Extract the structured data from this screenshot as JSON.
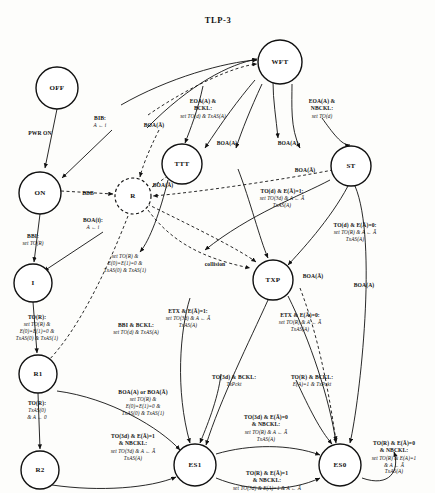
{
  "diagram": {
    "title": "TLP-3",
    "type": "state-transition-diagram",
    "states": [
      {
        "id": "OFF",
        "label": "OFF",
        "x": 57,
        "y": 88,
        "r": 21,
        "dashed": false
      },
      {
        "id": "ON",
        "label": "ON",
        "x": 40,
        "y": 193,
        "r": 21,
        "dashed": false
      },
      {
        "id": "I",
        "label": "I",
        "x": 33,
        "y": 283,
        "r": 19,
        "dashed": false
      },
      {
        "id": "R1",
        "label": "R1",
        "x": 38,
        "y": 374,
        "r": 19,
        "dashed": false
      },
      {
        "id": "R2",
        "label": "R2",
        "x": 40,
        "y": 470,
        "r": 19,
        "dashed": false
      },
      {
        "id": "R",
        "label": "R",
        "x": 133,
        "y": 196,
        "r": 18,
        "dashed": true
      },
      {
        "id": "TTT",
        "label": "TTT",
        "x": 182,
        "y": 164,
        "r": 20,
        "dashed": false
      },
      {
        "id": "WFT",
        "label": "WFT",
        "x": 280,
        "y": 62,
        "r": 22,
        "dashed": false
      },
      {
        "id": "ST",
        "label": "ST",
        "x": 351,
        "y": 166,
        "r": 20,
        "dashed": false
      },
      {
        "id": "TXP",
        "label": "TXP",
        "x": 273,
        "y": 280,
        "r": 20,
        "dashed": false
      },
      {
        "id": "ES1",
        "label": "ES1",
        "x": 195,
        "y": 465,
        "r": 21,
        "dashed": false
      },
      {
        "id": "ES0",
        "label": "ES0",
        "x": 340,
        "y": 465,
        "r": 21,
        "dashed": false
      }
    ],
    "labels": [
      {
        "id": "pwr-on",
        "cond": "PWR ON",
        "action": "",
        "x": 40,
        "y": 130
      },
      {
        "id": "bib",
        "cond": "BIB:",
        "action": "A ← i",
        "x": 100,
        "y": 115
      },
      {
        "id": "bbb",
        "cond": "BBB",
        "action": "",
        "x": 88,
        "y": 190
      },
      {
        "id": "boa-i",
        "cond": "BOA(i):",
        "action": "A ← i",
        "x": 93,
        "y": 217
      },
      {
        "id": "bbi",
        "cond": "BBI:",
        "action": "set TO(R)",
        "x": 33,
        "y": 233
      },
      {
        "id": "to-r-i",
        "cond": "TO(R):",
        "action": "set TO(R) &\nE(0)=E(1)=0 &\nTxAS(0) & TxAS(1)",
        "x": 37,
        "y": 314
      },
      {
        "id": "to-r-r1",
        "cond": "TO(R):",
        "action": "TxAS(0)\n& A ← 0",
        "x": 37,
        "y": 400
      },
      {
        "id": "boa-abar-1",
        "cond": "BOA(Ā)",
        "action": "",
        "x": 154,
        "y": 122
      },
      {
        "id": "boa-abar-2",
        "cond": "BOA(Ā)",
        "action": "",
        "x": 163,
        "y": 182
      },
      {
        "id": "eoa-bckl",
        "cond": "EOA(A) &\nBCKL:",
        "action": "set TO(d) & TxAS(A)",
        "x": 203,
        "y": 98
      },
      {
        "id": "eoa-nbckl",
        "cond": "EOA(A) &\nNBCKL:",
        "action": "set TO(d)",
        "x": 322,
        "y": 98
      },
      {
        "id": "boa-a-1",
        "cond": "BOA(A)",
        "action": "",
        "x": 227,
        "y": 140
      },
      {
        "id": "boa-a-2",
        "cond": "BOA(A)",
        "action": "",
        "x": 288,
        "y": 140
      },
      {
        "id": "boa-abar-st",
        "cond": "BOA(Ā)",
        "action": "",
        "x": 305,
        "y": 167
      },
      {
        "id": "to-d-e1",
        "cond": "TO(d) & E(Ā)=1:",
        "action": "set TO(3d) & A ← Ā\nTxAS(A)",
        "x": 282,
        "y": 188
      },
      {
        "id": "to-d-e0",
        "cond": "TO(d) & E(Ā)=0:",
        "action": "set TO(R) & A ← Ā\nTxAS(A)",
        "x": 355,
        "y": 222
      },
      {
        "id": "set-to-r-mid",
        "cond": "",
        "action": "set TO(R) &\nE(0)=E(1)=0 &\nTxAS(0) & TxAS(1)",
        "x": 125,
        "y": 253
      },
      {
        "id": "collision",
        "cond": "collision",
        "action": "",
        "x": 215,
        "y": 261
      },
      {
        "id": "boa-abar-txp",
        "cond": "BOA(Ā)",
        "action": "",
        "x": 313,
        "y": 273
      },
      {
        "id": "boa-a-es0",
        "cond": "BOA(A)",
        "action": "",
        "x": 364,
        "y": 282
      },
      {
        "id": "bbi-bckl",
        "cond": "BBI & BCKL:",
        "action": "set TO(d) & TxAS(A)",
        "x": 136,
        "y": 322
      },
      {
        "id": "etx-e1",
        "cond": "ETX & E(Ā)=1:",
        "action": "set TO(3d) & A ← Ā\nTxAS(A)",
        "x": 188,
        "y": 308
      },
      {
        "id": "etx-e0",
        "cond": "ETX & E(Ā)=0:",
        "action": "set TO(R) & A ← Ā\nTxAS(A)",
        "x": 300,
        "y": 312
      },
      {
        "id": "boa-or",
        "cond": "BOA(A) or BOA(Ā)",
        "action": "set TO(R) &\nE(0)=E(1)=0 &\nTxAS(0) & TxAS(1)",
        "x": 143,
        "y": 389
      },
      {
        "id": "to3d-bckl",
        "cond": "TO(3d) & BCKL:",
        "action": "TxPckt",
        "x": 234,
        "y": 374
      },
      {
        "id": "tor-bckl",
        "cond": "TO(R) & BCKL:",
        "action": "E(A)=1 & TxPckt",
        "x": 312,
        "y": 374
      },
      {
        "id": "to3d-e1-nbckl",
        "cond": "TO(3d) & E(Ā)=1\n& NBCKL:",
        "action": "set TO(3d) & A ← Ā\nTxAS(A)",
        "x": 133,
        "y": 433
      },
      {
        "id": "to3d-e0-nbckl",
        "cond": "TO(3d) & E(Ā)=0\n& NBCKL:",
        "action": "set TO(R) & A ← Ā\nTxAS(A)",
        "x": 266,
        "y": 414
      },
      {
        "id": "tor-e1-nbckl",
        "cond": "TO(R) & E(Ā)=1\n& NBCKL:",
        "action": "set TO(3d) & E(A)=1 & A ← Ā",
        "x": 267,
        "y": 470
      },
      {
        "id": "tor-e0-nbckl",
        "cond": "TO(R) & E(Ā)=0\n& NBCKL:",
        "action": "set TO(R) & E(A)=1\n& A ← Ā\nTxAS(A)",
        "x": 394,
        "y": 440
      }
    ],
    "colors": {
      "ink": "#111111",
      "background": "#fdfdfb"
    }
  }
}
